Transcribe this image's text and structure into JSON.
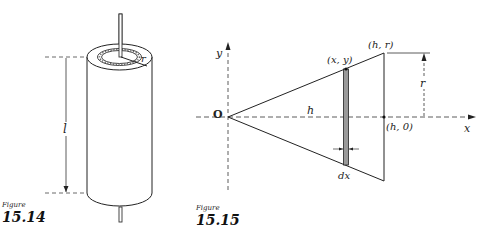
{
  "figure_1514": {
    "caption_word": "Figure",
    "caption_number": "15.14",
    "labels": {
      "length": "l",
      "radius": "r"
    }
  },
  "figure_1515": {
    "caption_word": "Figure",
    "caption_number": "15.15",
    "labels": {
      "y_axis": "y",
      "x_axis": "x",
      "origin": "O",
      "height": "h",
      "point_xy": "(x, y)",
      "point_hr": "(h, r)",
      "point_h0": "(h, 0)",
      "radius": "r",
      "strip_width": "dx"
    }
  }
}
